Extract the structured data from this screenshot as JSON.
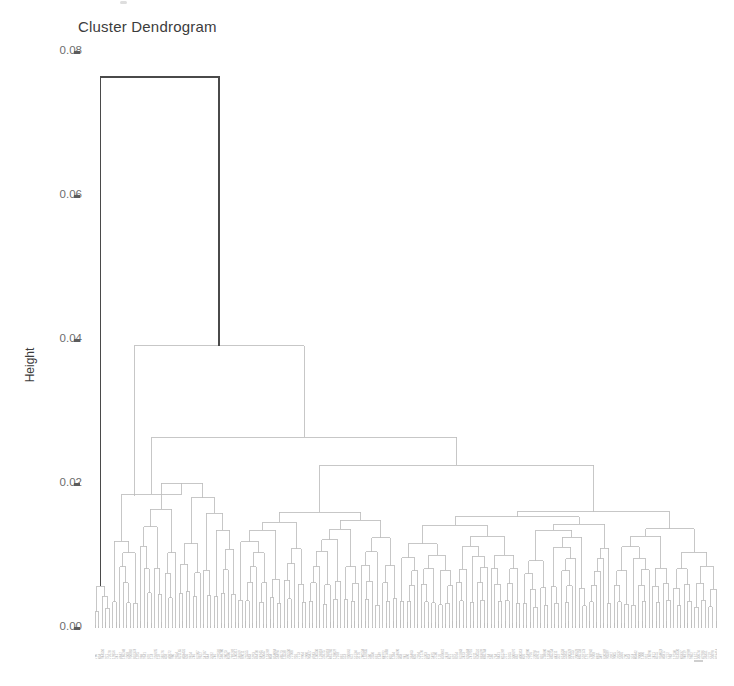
{
  "figure": {
    "title": "Cluster Dendrogram",
    "ylabel": "Height",
    "background": "#ffffff",
    "line_color": "#bdbdbd",
    "root_color": "#4a4a4a"
  },
  "axis": {
    "ticks": [
      {
        "label": "0.08",
        "value": 0.08
      },
      {
        "label": "0.06",
        "value": 0.06
      },
      {
        "label": "0.04",
        "value": 0.04
      },
      {
        "label": "0.02",
        "value": 0.02
      },
      {
        "label": "0.00",
        "value": 0.0
      }
    ]
  },
  "chart_data": {
    "type": "line",
    "subtype": "dendrogram",
    "title": "Cluster Dendrogram",
    "xlabel": "",
    "ylabel": "Height",
    "ylim": [
      0.0,
      0.08
    ],
    "grid": false,
    "legend": null,
    "orientation": "vertical",
    "leaf_count": 178,
    "leaf_labels_legible": false,
    "leaf_label_note": "Leaf tip labels are rendered as rotated micro-text and are illegible at source resolution.",
    "axis_ticks": [
      0.0,
      0.02,
      0.04,
      0.06,
      0.08
    ],
    "root_height": 0.0765,
    "merges": [
      {
        "id": "root",
        "height": 0.0765,
        "x_left": 106,
        "x_right": 310,
        "note": "root join; left arm descends to a near-zero singleton cluster"
      },
      {
        "id": "m2",
        "height": 0.0392,
        "x_left": 134,
        "x_right": 399
      },
      {
        "id": "m3",
        "height": 0.0265,
        "x_left": 196,
        "x_right": 519
      },
      {
        "id": "m4",
        "height": 0.023,
        "x_left": 249,
        "x_right": 601
      },
      {
        "id": "m5",
        "height": 0.0185,
        "x_left": 147,
        "x_right": 171
      },
      {
        "id": "m6",
        "height": 0.017,
        "x_left": 443,
        "x_right": 640
      },
      {
        "id": "m7",
        "height": 0.0148,
        "x_left": 160,
        "x_right": 184
      },
      {
        "id": "m8",
        "height": 0.0139,
        "x_left": 627,
        "x_right": 679
      },
      {
        "id": "m9",
        "height": 0.0125,
        "x_left": 196,
        "x_right": 208
      },
      {
        "id": "m10",
        "height": 0.0119,
        "x_left": 345,
        "x_right": 468
      },
      {
        "id": "m11",
        "height": 0.0112,
        "x_left": 139,
        "x_right": 157
      },
      {
        "id": "m12",
        "height": 0.0105,
        "x_left": 102,
        "x_right": 113
      },
      {
        "id": "m13",
        "height": 0.0098,
        "x_left": 659,
        "x_right": 697
      },
      {
        "id": "m14",
        "height": 0.0089,
        "x_left": 294,
        "x_right": 330
      },
      {
        "id": "m15",
        "height": 0.0082,
        "x_left": 573,
        "x_right": 619
      },
      {
        "id": "m16",
        "height": 0.0078,
        "x_left": 413,
        "x_right": 452
      },
      {
        "id": "m17",
        "height": 0.0071,
        "x_left": 498,
        "x_right": 545
      },
      {
        "id": "m18",
        "height": 0.0062,
        "x_left": 232,
        "x_right": 266
      }
    ],
    "structure_note": "Unbalanced agglomerative tree: one small left cluster splits off at 0.0765; remaining ~175 leaves merge progressively between 0.000 and 0.039, with dense terminal joins below 0.006."
  },
  "plot_area": {
    "x_left_px": 95,
    "x_right_px": 716,
    "y_top_px": 52,
    "y_bottom_px": 628
  }
}
